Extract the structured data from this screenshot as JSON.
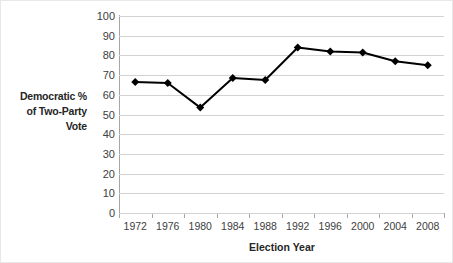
{
  "chart_data": {
    "type": "line",
    "title": "",
    "xlabel": "Election Year",
    "ylabel": "Democratic % of Two-Party Vote",
    "categories": [
      "1972",
      "1976",
      "1980",
      "1984",
      "1988",
      "1992",
      "1996",
      "2000",
      "2004",
      "2008"
    ],
    "values": [
      66.5,
      66,
      53.5,
      68.5,
      67.5,
      84,
      82,
      81.5,
      77,
      75
    ],
    "series": [
      {
        "name": "Democratic % of Two-Party Vote",
        "values": [
          66.5,
          66,
          53.5,
          68.5,
          67.5,
          84,
          82,
          81.5,
          77,
          75
        ]
      }
    ],
    "ylim": [
      0,
      100
    ],
    "ytick_step": 10,
    "yticks": [
      "100",
      "90",
      "80",
      "70",
      "60",
      "50",
      "40",
      "30",
      "20",
      "10",
      "0"
    ],
    "grid": "horizontal",
    "legend": "none",
    "marker": "diamond",
    "line_color": "#000000",
    "marker_color": "#000000",
    "gridline_color": "#d2d2d2",
    "axis_color": "#a6a6a6",
    "background_color": "#ffffff"
  },
  "axes": {
    "y_title_lines": [
      "Democratic %",
      "of Two-Party",
      "Vote"
    ],
    "x_title": "Election Year"
  }
}
